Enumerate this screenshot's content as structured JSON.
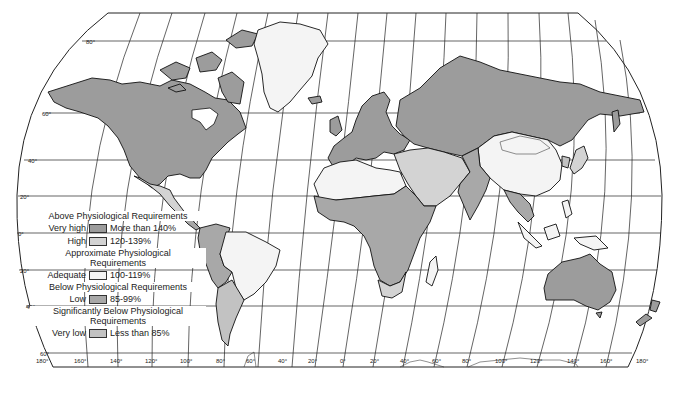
{
  "colors": {
    "very_high": "#9c9c9c",
    "high": "#d3d3d3",
    "adequate": "#f4f4f4",
    "low": "#a8a8a8",
    "very_low": "#c2c2c2",
    "water": "#ffffff",
    "line": "#222222"
  },
  "legend": {
    "groups": [
      {
        "heading": "Above Physiological Requirements",
        "rows": [
          {
            "level": "Very high",
            "range": "More than 140%",
            "color_key": "very_high"
          },
          {
            "level": "High",
            "range": "120-139%",
            "color_key": "high"
          }
        ]
      },
      {
        "heading": "Approximate Physiological Requirements",
        "rows": [
          {
            "level": "Adequate",
            "range": "100-119%",
            "color_key": "adequate"
          }
        ]
      },
      {
        "heading": "Below Physiological Requirements",
        "rows": [
          {
            "level": "Low",
            "range": "85-99%",
            "color_key": "low"
          }
        ]
      },
      {
        "heading": "Significantly Below Physiological Requirements",
        "rows": [
          {
            "level": "Very low",
            "range": "Less than 85%",
            "color_key": "very_low"
          }
        ]
      }
    ]
  },
  "latitude_labels": [
    "80°",
    "60°",
    "40°",
    "20°",
    "0°",
    "20°",
    "40°",
    "60°"
  ],
  "longitude_labels": [
    "180°",
    "160°",
    "140°",
    "120°",
    "100°",
    "80°",
    "60°",
    "40°",
    "20°",
    "0°",
    "20°",
    "40°",
    "60°",
    "80°",
    "100°",
    "120°",
    "140°",
    "160°",
    "180°"
  ],
  "regions": [
    {
      "name": "North America (USA, Canada)",
      "class": "very_high"
    },
    {
      "name": "Mexico",
      "class": "high"
    },
    {
      "name": "Greenland",
      "class": "adequate"
    },
    {
      "name": "Europe",
      "class": "very_high"
    },
    {
      "name": "USSR",
      "class": "very_high"
    },
    {
      "name": "China",
      "class": "adequate"
    },
    {
      "name": "Mongolia",
      "class": "adequate"
    },
    {
      "name": "South Asia",
      "class": "low"
    },
    {
      "name": "Middle East",
      "class": "high"
    },
    {
      "name": "North Africa",
      "class": "adequate"
    },
    {
      "name": "Sub-Saharan Africa",
      "class": "low"
    },
    {
      "name": "South Africa",
      "class": "high"
    },
    {
      "name": "Brazil",
      "class": "adequate"
    },
    {
      "name": "Argentina",
      "class": "high"
    },
    {
      "name": "Andean South America",
      "class": "low"
    },
    {
      "name": "Australia",
      "class": "very_high"
    },
    {
      "name": "New Zealand",
      "class": "very_high"
    },
    {
      "name": "Southeast Asia",
      "class": "low"
    },
    {
      "name": "Japan",
      "class": "high"
    }
  ]
}
